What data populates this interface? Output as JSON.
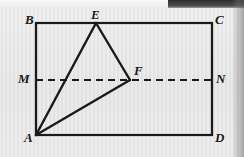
{
  "figure": {
    "type": "geometry-diagram",
    "background_color": "#e8e8e8",
    "stroke_color": "#1a1a1a",
    "canvas": {
      "width": 244,
      "height": 157
    },
    "rectangle": {
      "name": "rectangle-abcd",
      "left": 36,
      "top": 23,
      "right": 212,
      "bottom": 135,
      "stroke_width": 2.2
    },
    "midline": {
      "name": "segment-mn",
      "style": "dashed",
      "dash_pattern": "7 5",
      "x1": 36,
      "y1": 80,
      "x2": 212,
      "y2": 80,
      "stroke_width": 2.2
    },
    "points": {
      "A": {
        "x": 36,
        "y": 135
      },
      "B": {
        "x": 36,
        "y": 23
      },
      "C": {
        "x": 212,
        "y": 23
      },
      "D": {
        "x": 212,
        "y": 135
      },
      "M": {
        "x": 36,
        "y": 80
      },
      "N": {
        "x": 212,
        "y": 80
      },
      "E": {
        "x": 96,
        "y": 23
      },
      "F": {
        "x": 130,
        "y": 80
      }
    },
    "segments": [
      {
        "name": "segment-ae",
        "from": "A",
        "to": "E"
      },
      {
        "name": "segment-ef",
        "from": "E",
        "to": "F"
      },
      {
        "name": "segment-af",
        "from": "A",
        "to": "F"
      }
    ],
    "labels": [
      {
        "name": "vertex-label-b",
        "text": "B",
        "x": 25,
        "y": 13
      },
      {
        "name": "vertex-label-e",
        "text": "E",
        "x": 91,
        "y": 8
      },
      {
        "name": "vertex-label-c",
        "text": "C",
        "x": 215,
        "y": 13
      },
      {
        "name": "vertex-label-m",
        "text": "M",
        "x": 18,
        "y": 72
      },
      {
        "name": "vertex-label-f",
        "text": "F",
        "x": 134,
        "y": 64
      },
      {
        "name": "vertex-label-n",
        "text": "N",
        "x": 216,
        "y": 72
      },
      {
        "name": "vertex-label-a",
        "text": "A",
        "x": 24,
        "y": 131
      },
      {
        "name": "vertex-label-d",
        "text": "D",
        "x": 215,
        "y": 131
      }
    ]
  }
}
